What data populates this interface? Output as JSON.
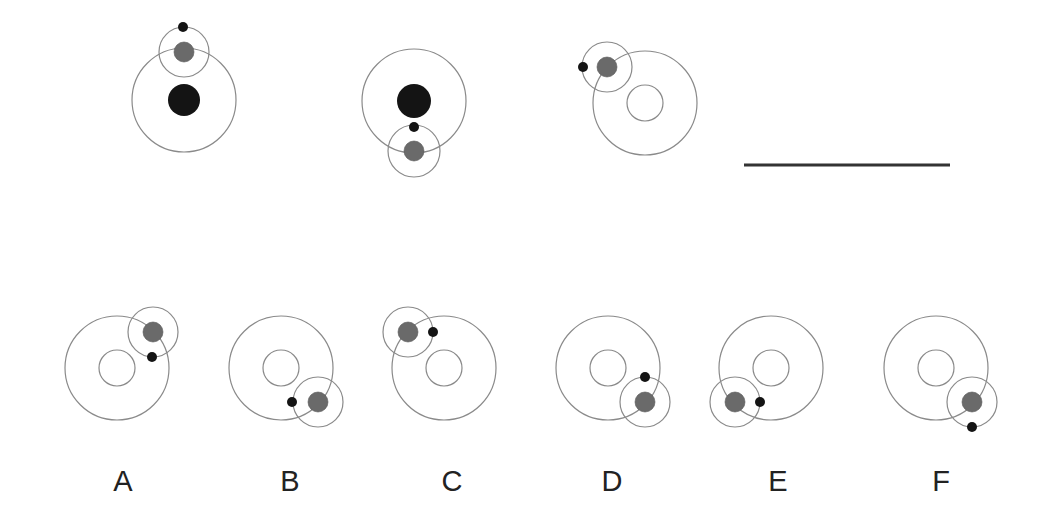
{
  "figure": {
    "colors": {
      "orbit": "#8a8a8a",
      "sun": "#141414",
      "planet": "#6a6a6a",
      "moon": "#141414",
      "scale_bar": "#333333"
    },
    "reference_panels": [
      {
        "id": "ref-1",
        "big_orbit": {
          "cx": 184,
          "cy": 100,
          "r": 52
        },
        "center": {
          "type": "sun",
          "r": 16
        },
        "small_orbit": {
          "cx": 184,
          "cy": 52,
          "r": 25
        },
        "planet": {
          "cx": 184,
          "cy": 52,
          "r": 10
        },
        "moon": {
          "cx": 183,
          "cy": 27,
          "r": 5
        }
      },
      {
        "id": "ref-2",
        "big_orbit": {
          "cx": 414,
          "cy": 101,
          "r": 52
        },
        "center": {
          "type": "sun",
          "r": 17
        },
        "small_orbit": {
          "cx": 414,
          "cy": 151,
          "r": 26
        },
        "planet": {
          "cx": 414,
          "cy": 151,
          "r": 10
        },
        "moon": {
          "cx": 414,
          "cy": 127,
          "r": 5
        }
      },
      {
        "id": "ref-3",
        "big_orbit": {
          "cx": 645,
          "cy": 103,
          "r": 52
        },
        "center": {
          "type": "hollow",
          "r": 18
        },
        "small_orbit": {
          "cx": 607,
          "cy": 67,
          "r": 25
        },
        "planet": {
          "cx": 607,
          "cy": 67,
          "r": 10
        },
        "moon": {
          "cx": 583,
          "cy": 67,
          "r": 5
        }
      }
    ],
    "scale_bar": {
      "x1": 744,
      "x2": 950,
      "y": 165
    },
    "options": [
      {
        "label": "A",
        "label_x": 123,
        "big_orbit": {
          "cx": 117,
          "cy": 368,
          "r": 52
        },
        "inner_r": 18,
        "small_orbit": {
          "cx": 153,
          "cy": 332,
          "r": 25
        },
        "planet": {
          "cx": 153,
          "cy": 332,
          "r": 10
        },
        "moon": {
          "cx": 152,
          "cy": 357,
          "r": 5
        }
      },
      {
        "label": "B",
        "label_x": 290,
        "big_orbit": {
          "cx": 281,
          "cy": 368,
          "r": 52
        },
        "inner_r": 18,
        "small_orbit": {
          "cx": 318,
          "cy": 402,
          "r": 25
        },
        "planet": {
          "cx": 318,
          "cy": 402,
          "r": 10
        },
        "moon": {
          "cx": 292,
          "cy": 402,
          "r": 5
        }
      },
      {
        "label": "C",
        "label_x": 452,
        "big_orbit": {
          "cx": 444,
          "cy": 368,
          "r": 52
        },
        "inner_r": 18,
        "small_orbit": {
          "cx": 408,
          "cy": 332,
          "r": 25
        },
        "planet": {
          "cx": 408,
          "cy": 332,
          "r": 10
        },
        "moon": {
          "cx": 433,
          "cy": 332,
          "r": 5
        }
      },
      {
        "label": "D",
        "label_x": 612,
        "big_orbit": {
          "cx": 608,
          "cy": 368,
          "r": 52
        },
        "inner_r": 18,
        "small_orbit": {
          "cx": 645,
          "cy": 402,
          "r": 25
        },
        "planet": {
          "cx": 645,
          "cy": 402,
          "r": 10
        },
        "moon": {
          "cx": 645,
          "cy": 377,
          "r": 5
        }
      },
      {
        "label": "E",
        "label_x": 778,
        "big_orbit": {
          "cx": 771,
          "cy": 368,
          "r": 52
        },
        "inner_r": 18,
        "small_orbit": {
          "cx": 735,
          "cy": 402,
          "r": 25
        },
        "planet": {
          "cx": 735,
          "cy": 402,
          "r": 10
        },
        "moon": {
          "cx": 760,
          "cy": 402,
          "r": 5
        }
      },
      {
        "label": "F",
        "label_x": 941,
        "big_orbit": {
          "cx": 936,
          "cy": 368,
          "r": 52
        },
        "inner_r": 18,
        "small_orbit": {
          "cx": 972,
          "cy": 402,
          "r": 25
        },
        "planet": {
          "cx": 972,
          "cy": 402,
          "r": 10
        },
        "moon": {
          "cx": 972,
          "cy": 427,
          "r": 5
        }
      }
    ],
    "labels_y": 467
  }
}
